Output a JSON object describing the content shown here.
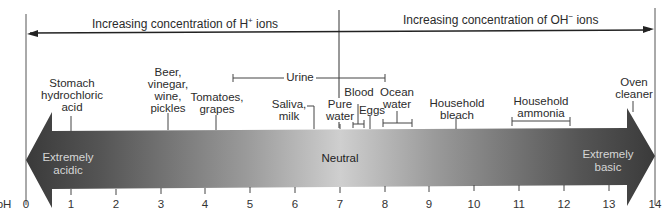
{
  "top_arrows": {
    "left": {
      "text": "Increasing concentration of H",
      "superscript": "+",
      "suffix": " ions",
      "direction": "left"
    },
    "right": {
      "text": "Increasing concentration of OH",
      "superscript": "−",
      "suffix": " ions",
      "direction": "right"
    }
  },
  "scale": {
    "axis_label": "pH",
    "ticks": [
      "0",
      "1",
      "2",
      "3",
      "4",
      "5",
      "6",
      "7",
      "8",
      "9",
      "10",
      "11",
      "12",
      "13",
      "14"
    ],
    "regions": {
      "acidic": "Extremely\nacidic",
      "neutral": "Neutral",
      "basic": "Extremely\nbasic"
    },
    "colors": {
      "dark": "#3a3a3a",
      "mid": "#c8c8c8",
      "light_text": "#d9d9d9",
      "dark_text": "#222222"
    }
  },
  "substances": [
    {
      "name": "Stomach\nhydrochloric\nacid",
      "ph": 1.0
    },
    {
      "name": "Beer,\nvinegar,\nwine,\npickles",
      "ph": 3.0
    },
    {
      "name": "Tomatoes,\ngrapes",
      "ph": 4.2
    },
    {
      "name": "Urine",
      "ph_range": [
        4.6,
        8.0
      ]
    },
    {
      "name": "Saliva,\nmilk",
      "ph": 6.5
    },
    {
      "name": "Pure\nwater",
      "ph": 7.0
    },
    {
      "name": "Blood",
      "ph_range": [
        7.3,
        7.6
      ]
    },
    {
      "name": "Eggs",
      "ph": 7.8
    },
    {
      "name": "Ocean\nwater",
      "ph_range": [
        7.9,
        8.6
      ]
    },
    {
      "name": "Household\nbleach",
      "ph": 9.5
    },
    {
      "name": "Household\nammonia",
      "ph_range": [
        10.8,
        12.1
      ]
    },
    {
      "name": "Oven\ncleaner",
      "ph": 13.5
    }
  ]
}
